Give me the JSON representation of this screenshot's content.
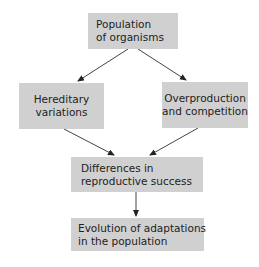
{
  "diagram": {
    "type": "flowchart",
    "nodes": [
      {
        "id": "population",
        "lines": [
          "Population",
          "of organisms"
        ]
      },
      {
        "id": "hereditary",
        "lines": [
          "Hereditary",
          "variations"
        ]
      },
      {
        "id": "overproduction",
        "lines": [
          "Overproduction",
          "and competition"
        ]
      },
      {
        "id": "differences",
        "lines": [
          "Differences in",
          "reproductive success"
        ]
      },
      {
        "id": "evolution",
        "lines": [
          "Evolution of adaptations",
          "in the population"
        ]
      }
    ],
    "edges": [
      {
        "from": "population",
        "to": "hereditary"
      },
      {
        "from": "population",
        "to": "overproduction"
      },
      {
        "from": "hereditary",
        "to": "differences"
      },
      {
        "from": "overproduction",
        "to": "differences"
      },
      {
        "from": "differences",
        "to": "evolution"
      }
    ],
    "box_color": "#d0d0d0",
    "arrow_color": "#333333"
  }
}
